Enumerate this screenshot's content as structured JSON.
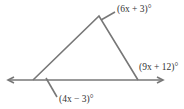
{
  "diagram": {
    "type": "triangle with extended base line and angle labels",
    "labels": {
      "top_angle": "(6x + 3)°",
      "exterior_right_angle": "(9x + 12)°",
      "left_interior_angle": "(4x − 3)°"
    },
    "colors": {
      "lines": "#777777",
      "text": "#333333"
    }
  }
}
